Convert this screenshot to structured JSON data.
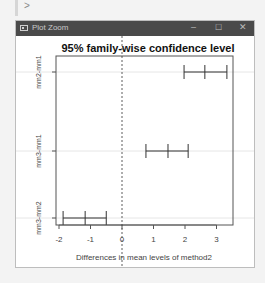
{
  "console": {
    "prompt": ">"
  },
  "window": {
    "title": "Plot Zoom",
    "controls": {
      "minimize": "–",
      "maximize": "☐",
      "close": "✕"
    }
  },
  "chart_data": {
    "type": "errorbar",
    "title": "95% family-wise confidence level",
    "xlabel": "Differences in mean levels of method2",
    "ylabel": "",
    "xlim": [
      -2,
      3.5
    ],
    "xticks": [
      -2,
      -1,
      0,
      1,
      2,
      3
    ],
    "xtick_labels": [
      "-2",
      "-1",
      "0",
      "1",
      "2",
      "3"
    ],
    "reference_line": 0,
    "grid": false,
    "categories": [
      "mm2-mm1",
      "mm3-mm1",
      "mm3-mm2"
    ],
    "series": [
      {
        "name": "diff",
        "values": [
          2.63,
          1.46,
          -1.17
        ]
      },
      {
        "name": "lwr",
        "values": [
          1.97,
          0.76,
          -1.87
        ]
      },
      {
        "name": "upr",
        "values": [
          3.33,
          2.1,
          -0.5
        ]
      }
    ]
  }
}
